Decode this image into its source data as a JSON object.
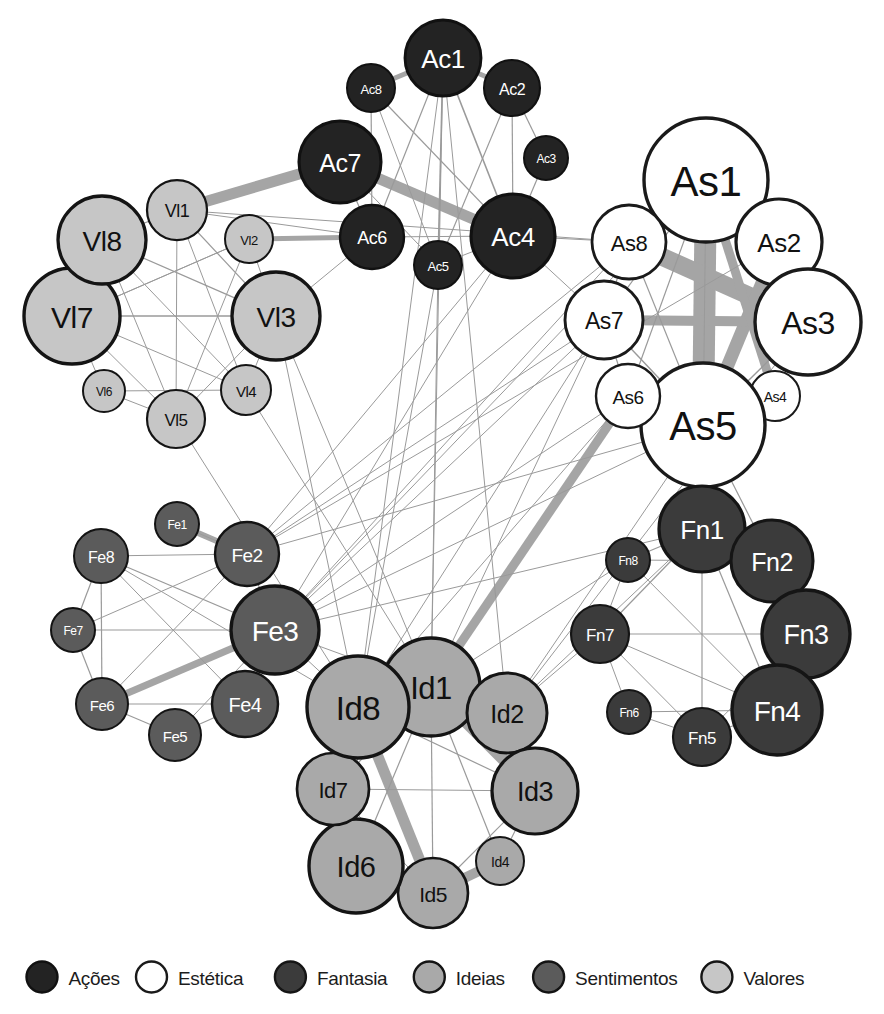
{
  "figure": {
    "type": "network-graph",
    "background": "#ffffff",
    "width": 884,
    "height": 1014
  },
  "legend": {
    "position": "bottom",
    "items": [
      {
        "label": "Ações",
        "prefix": "Ac",
        "fill": "#232323",
        "stroke": "#111111",
        "text_color": "#ffffff"
      },
      {
        "label": "Estética",
        "prefix": "As",
        "fill": "#ffffff",
        "stroke": "#1a1a1a",
        "text_color": "#111111"
      },
      {
        "label": "Fantasia",
        "prefix": "Fn",
        "fill": "#3b3b3b",
        "stroke": "#151515",
        "text_color": "#ffffff"
      },
      {
        "label": "Ideias",
        "prefix": "Id",
        "fill": "#a9a9a9",
        "stroke": "#141414",
        "text_color": "#111111"
      },
      {
        "label": "Sentimentos",
        "prefix": "Fe",
        "fill": "#5b5b5b",
        "stroke": "#131313",
        "text_color": "#ffffff"
      },
      {
        "label": "Valores",
        "prefix": "Vl",
        "fill": "#c6c6c6",
        "stroke": "#141414",
        "text_color": "#111111"
      }
    ],
    "swatch_positions": [
      42,
      237,
      440,
      620,
      767
    ]
  },
  "chart_data": {
    "type": "network",
    "title": "",
    "groups": [
      "Ações",
      "Estética",
      "Fantasia",
      "Ideias",
      "Sentimentos",
      "Valores"
    ],
    "nodes": [
      {
        "id": "Ac1",
        "group": "Ações",
        "x": 443,
        "y": 58,
        "r": 38,
        "fs": 26
      },
      {
        "id": "Ac2",
        "group": "Ações",
        "x": 512,
        "y": 88,
        "r": 28,
        "fs": 16
      },
      {
        "id": "Ac3",
        "group": "Ações",
        "x": 546,
        "y": 158,
        "r": 22,
        "fs": 12
      },
      {
        "id": "Ac4",
        "group": "Ações",
        "x": 513,
        "y": 236,
        "r": 42,
        "fs": 26
      },
      {
        "id": "Ac5",
        "group": "Ações",
        "x": 438,
        "y": 265,
        "r": 24,
        "fs": 13
      },
      {
        "id": "Ac6",
        "group": "Ações",
        "x": 372,
        "y": 237,
        "r": 32,
        "fs": 18
      },
      {
        "id": "Ac7",
        "group": "Ações",
        "x": 340,
        "y": 162,
        "r": 41,
        "fs": 25
      },
      {
        "id": "Ac8",
        "group": "Ações",
        "x": 371,
        "y": 88,
        "r": 24,
        "fs": 13
      },
      {
        "id": "As1",
        "group": "Estética",
        "x": 706,
        "y": 180,
        "r": 62,
        "fs": 42
      },
      {
        "id": "As2",
        "group": "Estética",
        "x": 779,
        "y": 242,
        "r": 43,
        "fs": 26
      },
      {
        "id": "As3",
        "group": "Estética",
        "x": 808,
        "y": 322,
        "r": 53,
        "fs": 32
      },
      {
        "id": "As4",
        "group": "Estética",
        "x": 775,
        "y": 396,
        "r": 25,
        "fs": 14
      },
      {
        "id": "As5",
        "group": "Estética",
        "x": 703,
        "y": 425,
        "r": 62,
        "fs": 40
      },
      {
        "id": "As6",
        "group": "Estética",
        "x": 628,
        "y": 396,
        "r": 32,
        "fs": 19
      },
      {
        "id": "As7",
        "group": "Estética",
        "x": 604,
        "y": 320,
        "r": 39,
        "fs": 23
      },
      {
        "id": "As8",
        "group": "Estética",
        "x": 629,
        "y": 242,
        "r": 37,
        "fs": 22
      },
      {
        "id": "Fn1",
        "group": "Fantasia",
        "x": 702,
        "y": 529,
        "r": 43,
        "fs": 26
      },
      {
        "id": "Fn2",
        "group": "Fantasia",
        "x": 772,
        "y": 561,
        "r": 41,
        "fs": 25
      },
      {
        "id": "Fn3",
        "group": "Fantasia",
        "x": 806,
        "y": 634,
        "r": 44,
        "fs": 27
      },
      {
        "id": "Fn4",
        "group": "Fantasia",
        "x": 777,
        "y": 710,
        "r": 45,
        "fs": 28
      },
      {
        "id": "Fn5",
        "group": "Fantasia",
        "x": 702,
        "y": 737,
        "r": 29,
        "fs": 17
      },
      {
        "id": "Fn6",
        "group": "Fantasia",
        "x": 629,
        "y": 712,
        "r": 22,
        "fs": 12
      },
      {
        "id": "Fn7",
        "group": "Fantasia",
        "x": 600,
        "y": 634,
        "r": 29,
        "fs": 17
      },
      {
        "id": "Fn8",
        "group": "Fantasia",
        "x": 628,
        "y": 560,
        "r": 22,
        "fs": 12
      },
      {
        "id": "Id1",
        "group": "Ideias",
        "x": 431,
        "y": 687,
        "r": 49,
        "fs": 31
      },
      {
        "id": "Id2",
        "group": "Ideias",
        "x": 507,
        "y": 713,
        "r": 40,
        "fs": 25
      },
      {
        "id": "Id3",
        "group": "Ideias",
        "x": 535,
        "y": 791,
        "r": 43,
        "fs": 27
      },
      {
        "id": "Id4",
        "group": "Ideias",
        "x": 500,
        "y": 861,
        "r": 24,
        "fs": 14
      },
      {
        "id": "Id5",
        "group": "Ideias",
        "x": 433,
        "y": 893,
        "r": 35,
        "fs": 21
      },
      {
        "id": "Id6",
        "group": "Ideias",
        "x": 356,
        "y": 866,
        "r": 47,
        "fs": 29
      },
      {
        "id": "Id7",
        "group": "Ideias",
        "x": 333,
        "y": 789,
        "r": 36,
        "fs": 22
      },
      {
        "id": "Id8",
        "group": "Ideias",
        "x": 358,
        "y": 707,
        "r": 51,
        "fs": 33
      },
      {
        "id": "Fe1",
        "group": "Sentimentos",
        "x": 177,
        "y": 524,
        "r": 22,
        "fs": 12
      },
      {
        "id": "Fe2",
        "group": "Sentimentos",
        "x": 247,
        "y": 554,
        "r": 32,
        "fs": 19
      },
      {
        "id": "Fe3",
        "group": "Sentimentos",
        "x": 275,
        "y": 630,
        "r": 44,
        "fs": 28
      },
      {
        "id": "Fe4",
        "group": "Sentimentos",
        "x": 245,
        "y": 704,
        "r": 33,
        "fs": 20
      },
      {
        "id": "Fe5",
        "group": "Sentimentos",
        "x": 175,
        "y": 735,
        "r": 26,
        "fs": 15
      },
      {
        "id": "Fe6",
        "group": "Sentimentos",
        "x": 102,
        "y": 704,
        "r": 26,
        "fs": 15
      },
      {
        "id": "Fe7",
        "group": "Sentimentos",
        "x": 73,
        "y": 630,
        "r": 22,
        "fs": 12
      },
      {
        "id": "Fe8",
        "group": "Sentimentos",
        "x": 101,
        "y": 556,
        "r": 27,
        "fs": 16
      },
      {
        "id": "Vl1",
        "group": "Valores",
        "x": 177,
        "y": 210,
        "r": 30,
        "fs": 18
      },
      {
        "id": "Vl2",
        "group": "Valores",
        "x": 249,
        "y": 239,
        "r": 24,
        "fs": 13
      },
      {
        "id": "Vl3",
        "group": "Valores",
        "x": 276,
        "y": 316,
        "r": 44,
        "fs": 28
      },
      {
        "id": "Vl4",
        "group": "Valores",
        "x": 246,
        "y": 390,
        "r": 25,
        "fs": 15
      },
      {
        "id": "Vl5",
        "group": "Valores",
        "x": 176,
        "y": 419,
        "r": 29,
        "fs": 17
      },
      {
        "id": "Vl6",
        "group": "Valores",
        "x": 104,
        "y": 391,
        "r": 21,
        "fs": 12
      },
      {
        "id": "Vl7",
        "group": "Valores",
        "x": 72,
        "y": 316,
        "r": 48,
        "fs": 30
      },
      {
        "id": "Vl8",
        "group": "Valores",
        "x": 102,
        "y": 240,
        "r": 44,
        "fs": 28
      }
    ],
    "edges": [
      {
        "s": "Vl1",
        "t": "Ac7",
        "w": 11
      },
      {
        "s": "Ac7",
        "t": "Ac4",
        "w": 11
      },
      {
        "s": "Ac1",
        "t": "Ac2",
        "w": 5
      },
      {
        "s": "Ac1",
        "t": "Ac8",
        "w": 5
      },
      {
        "s": "Vl2",
        "t": "Ac6",
        "w": 5
      },
      {
        "s": "Fe1",
        "t": "Fe2",
        "w": 6
      },
      {
        "s": "Fe6",
        "t": "Fe3",
        "w": 7
      },
      {
        "s": "As1",
        "t": "As5",
        "w": 22
      },
      {
        "s": "As8",
        "t": "As3",
        "w": 18
      },
      {
        "s": "As2",
        "t": "As5",
        "w": 13
      },
      {
        "s": "As7",
        "t": "As3",
        "w": 10
      },
      {
        "s": "As1",
        "t": "As4",
        "w": 9
      },
      {
        "s": "As6",
        "t": "Id1",
        "w": 9
      },
      {
        "s": "Id1",
        "t": "Id3",
        "w": 12
      },
      {
        "s": "Id8",
        "t": "Id5",
        "w": 11
      },
      {
        "s": "Id5",
        "t": "Id4",
        "w": 10
      },
      {
        "s": "Ac1",
        "t": "Ac4",
        "w": 1.6
      },
      {
        "s": "Ac1",
        "t": "Ac5",
        "w": 1.6
      },
      {
        "s": "Ac1",
        "t": "Ac6",
        "w": 1.2
      },
      {
        "s": "Ac1",
        "t": "Id1",
        "w": 1
      },
      {
        "s": "Ac1",
        "t": "Id8",
        "w": 1
      },
      {
        "s": "Ac2",
        "t": "Ac3",
        "w": 1.2
      },
      {
        "s": "Ac2",
        "t": "Ac4",
        "w": 1.2
      },
      {
        "s": "Ac2",
        "t": "Ac5",
        "w": 1.2
      },
      {
        "s": "Ac3",
        "t": "Ac4",
        "w": 1.2
      },
      {
        "s": "Ac8",
        "t": "Ac6",
        "w": 1.2
      },
      {
        "s": "Ac8",
        "t": "Ac4",
        "w": 1.2
      },
      {
        "s": "Ac8",
        "t": "Ac5",
        "w": 1
      },
      {
        "s": "Ac7",
        "t": "Ac6",
        "w": 1.2
      },
      {
        "s": "Ac7",
        "t": "Ac5",
        "w": 1
      },
      {
        "s": "Ac4",
        "t": "Ac6",
        "w": 1
      },
      {
        "s": "Ac4",
        "t": "Ac5",
        "w": 1
      },
      {
        "s": "Ac4",
        "t": "As8",
        "w": 1
      },
      {
        "s": "Ac4",
        "t": "As7",
        "w": 1
      },
      {
        "s": "Ac6",
        "t": "Vl3",
        "w": 1
      },
      {
        "s": "Ac6",
        "t": "Vl1",
        "w": 1
      },
      {
        "s": "Ac5",
        "t": "Id1",
        "w": 1
      },
      {
        "s": "Ac5",
        "t": "Id8",
        "w": 1
      },
      {
        "s": "Vl8",
        "t": "Vl1",
        "w": 1.3
      },
      {
        "s": "Vl8",
        "t": "Vl7",
        "w": 1.3
      },
      {
        "s": "Vl8",
        "t": "Vl3",
        "w": 1.2
      },
      {
        "s": "Vl8",
        "t": "Vl4",
        "w": 1
      },
      {
        "s": "Vl8",
        "t": "Vl5",
        "w": 1
      },
      {
        "s": "Vl7",
        "t": "Vl3",
        "w": 1.4
      },
      {
        "s": "Vl7",
        "t": "Vl2",
        "w": 1
      },
      {
        "s": "Vl7",
        "t": "Vl4",
        "w": 1
      },
      {
        "s": "Vl7",
        "t": "Vl5",
        "w": 1
      },
      {
        "s": "Vl7",
        "t": "Vl6",
        "w": 1
      },
      {
        "s": "Vl1",
        "t": "Vl3",
        "w": 1.2
      },
      {
        "s": "Vl1",
        "t": "Vl4",
        "w": 1
      },
      {
        "s": "Vl1",
        "t": "Vl5",
        "w": 1
      },
      {
        "s": "Vl2",
        "t": "Vl3",
        "w": 1
      },
      {
        "s": "Vl2",
        "t": "Vl5",
        "w": 1
      },
      {
        "s": "Vl2",
        "t": "Vl7",
        "w": 1
      },
      {
        "s": "Vl3",
        "t": "Vl5",
        "w": 1
      },
      {
        "s": "Vl3",
        "t": "Vl4",
        "w": 1
      },
      {
        "s": "Vl6",
        "t": "Vl4",
        "w": 1
      },
      {
        "s": "Vl6",
        "t": "Vl5",
        "w": 1
      },
      {
        "s": "Vl3",
        "t": "Id8",
        "w": 1
      },
      {
        "s": "Vl3",
        "t": "Id1",
        "w": 1
      },
      {
        "s": "Vl5",
        "t": "Id8",
        "w": 1
      },
      {
        "s": "Vl4",
        "t": "Id1",
        "w": 1
      },
      {
        "s": "Vl1",
        "t": "As8",
        "w": 1
      },
      {
        "s": "As1",
        "t": "As2",
        "w": 1.4
      },
      {
        "s": "As1",
        "t": "As8",
        "w": 1.4
      },
      {
        "s": "As1",
        "t": "As3",
        "w": 1.2
      },
      {
        "s": "As1",
        "t": "As7",
        "w": 1.2
      },
      {
        "s": "As1",
        "t": "As6",
        "w": 1.2
      },
      {
        "s": "As5",
        "t": "As3",
        "w": 1.4
      },
      {
        "s": "As5",
        "t": "As7",
        "w": 1.4
      },
      {
        "s": "As5",
        "t": "As8",
        "w": 1.2
      },
      {
        "s": "As5",
        "t": "As4",
        "w": 1.2
      },
      {
        "s": "As5",
        "t": "As6",
        "w": 1.2
      },
      {
        "s": "As5",
        "t": "Fn1",
        "w": 1.4
      },
      {
        "s": "As5",
        "t": "Fn2",
        "w": 1.2
      },
      {
        "s": "As3",
        "t": "As4",
        "w": 1.2
      },
      {
        "s": "As2",
        "t": "As3",
        "w": 1.2
      },
      {
        "s": "As7",
        "t": "As6",
        "w": 1.2
      },
      {
        "s": "As8",
        "t": "As7",
        "w": 1.2
      },
      {
        "s": "As7",
        "t": "Fe3",
        "w": 1
      },
      {
        "s": "As7",
        "t": "Fe2",
        "w": 1
      },
      {
        "s": "As6",
        "t": "Id8",
        "w": 1
      },
      {
        "s": "As6",
        "t": "Fe3",
        "w": 1
      },
      {
        "s": "As1",
        "t": "Fn1",
        "w": 1
      },
      {
        "s": "As5",
        "t": "Id2",
        "w": 1
      },
      {
        "s": "Fn1",
        "t": "Fn2",
        "w": 1.4
      },
      {
        "s": "Fn1",
        "t": "Fn3",
        "w": 1.2
      },
      {
        "s": "Fn1",
        "t": "Fn4",
        "w": 1.2
      },
      {
        "s": "Fn1",
        "t": "Fn5",
        "w": 1.2
      },
      {
        "s": "Fn1",
        "t": "Fn7",
        "w": 1.2
      },
      {
        "s": "Fn1",
        "t": "Fn8",
        "w": 1.2
      },
      {
        "s": "Fn2",
        "t": "Fn3",
        "w": 1.2
      },
      {
        "s": "Fn2",
        "t": "Fn4",
        "w": 1.2
      },
      {
        "s": "Fn3",
        "t": "Fn4",
        "w": 1.2
      },
      {
        "s": "Fn3",
        "t": "Fn7",
        "w": 1.2
      },
      {
        "s": "Fn3",
        "t": "Fn5",
        "w": 1
      },
      {
        "s": "Fn4",
        "t": "Fn5",
        "w": 1.2
      },
      {
        "s": "Fn4",
        "t": "Fn6",
        "w": 1
      },
      {
        "s": "Fn4",
        "t": "Fn7",
        "w": 1
      },
      {
        "s": "Fn5",
        "t": "Fn6",
        "w": 1
      },
      {
        "s": "Fn5",
        "t": "Fn7",
        "w": 1
      },
      {
        "s": "Fn6",
        "t": "Fn7",
        "w": 1
      },
      {
        "s": "Fn7",
        "t": "Fn8",
        "w": 1
      },
      {
        "s": "Fn8",
        "t": "Fn2",
        "w": 1
      },
      {
        "s": "Fn8",
        "t": "Fn4",
        "w": 1
      },
      {
        "s": "Fn7",
        "t": "Id2",
        "w": 1
      },
      {
        "s": "Fn8",
        "t": "Id1",
        "w": 1
      },
      {
        "s": "Fe8",
        "t": "Fe7",
        "w": 1.2
      },
      {
        "s": "Fe8",
        "t": "Fe6",
        "w": 1.2
      },
      {
        "s": "Fe8",
        "t": "Fe3",
        "w": 1.2
      },
      {
        "s": "Fe8",
        "t": "Fe4",
        "w": 1
      },
      {
        "s": "Fe8",
        "t": "Fe2",
        "w": 1
      },
      {
        "s": "Fe7",
        "t": "Fe6",
        "w": 1.2
      },
      {
        "s": "Fe7",
        "t": "Fe3",
        "w": 1.2
      },
      {
        "s": "Fe7",
        "t": "Fe2",
        "w": 1
      },
      {
        "s": "Fe6",
        "t": "Fe4",
        "w": 1.2
      },
      {
        "s": "Fe6",
        "t": "Fe5",
        "w": 1.2
      },
      {
        "s": "Fe6",
        "t": "Fe2",
        "w": 1
      },
      {
        "s": "Fe5",
        "t": "Fe4",
        "w": 1.2
      },
      {
        "s": "Fe5",
        "t": "Fe3",
        "w": 1
      },
      {
        "s": "Fe4",
        "t": "Fe3",
        "w": 1.2
      },
      {
        "s": "Fe3",
        "t": "Fe2",
        "w": 1.2
      },
      {
        "s": "Fe2",
        "t": "Fe1",
        "w": 1
      },
      {
        "s": "Fe3",
        "t": "Id8",
        "w": 1
      },
      {
        "s": "Fe3",
        "t": "Id1",
        "w": 1
      },
      {
        "s": "Fe3",
        "t": "As1",
        "w": 1
      },
      {
        "s": "Fe3",
        "t": "As8",
        "w": 1
      },
      {
        "s": "Fe2",
        "t": "As1",
        "w": 1
      },
      {
        "s": "Fe2",
        "t": "As2",
        "w": 1
      },
      {
        "s": "Fe2",
        "t": "Ac4",
        "w": 1
      },
      {
        "s": "Fe3",
        "t": "Ac4",
        "w": 1
      },
      {
        "s": "Fe3",
        "t": "Fn1",
        "w": 1
      },
      {
        "s": "Fe3",
        "t": "As5",
        "w": 1
      },
      {
        "s": "Fe2",
        "t": "As5",
        "w": 1
      },
      {
        "s": "Fe8",
        "t": "Id8",
        "w": 1
      },
      {
        "s": "Id1",
        "t": "Id2",
        "w": 1.4
      },
      {
        "s": "Id1",
        "t": "Id8",
        "w": 1.4
      },
      {
        "s": "Id1",
        "t": "Id7",
        "w": 1.2
      },
      {
        "s": "Id1",
        "t": "Id6",
        "w": 1.2
      },
      {
        "s": "Id1",
        "t": "Id5",
        "w": 1.2
      },
      {
        "s": "Id1",
        "t": "Id4",
        "w": 1.2
      },
      {
        "s": "Id8",
        "t": "Id7",
        "w": 1.2
      },
      {
        "s": "Id8",
        "t": "Id6",
        "w": 1.2
      },
      {
        "s": "Id8",
        "t": "Id2",
        "w": 1.2
      },
      {
        "s": "Id8",
        "t": "Id3",
        "w": 1.2
      },
      {
        "s": "Id2",
        "t": "Id3",
        "w": 1.2
      },
      {
        "s": "Id3",
        "t": "Id4",
        "w": 1.2
      },
      {
        "s": "Id3",
        "t": "Id5",
        "w": 1.2
      },
      {
        "s": "Id3",
        "t": "Id7",
        "w": 1
      },
      {
        "s": "Id5",
        "t": "Id6",
        "w": 1.2
      },
      {
        "s": "Id6",
        "t": "Id7",
        "w": 1.2
      },
      {
        "s": "Id7",
        "t": "Id5",
        "w": 1
      },
      {
        "s": "Id2",
        "t": "Ac1",
        "w": 1
      },
      {
        "s": "Id1",
        "t": "As7",
        "w": 1
      },
      {
        "s": "Id8",
        "t": "As7",
        "w": 1
      },
      {
        "s": "Id2",
        "t": "Fn1",
        "w": 1
      },
      {
        "s": "Id2",
        "t": "As3",
        "w": 1
      }
    ],
    "edge_color_thin": "#9a9a9a",
    "edge_color_thick": "#a5a5a5"
  }
}
